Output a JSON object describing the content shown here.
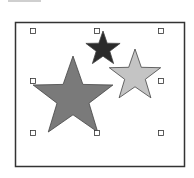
{
  "canvas": {
    "frame": {
      "x": 15.5,
      "y": 22.5,
      "w": 169,
      "h": 144,
      "stroke": "#333333"
    },
    "selection_handles": [
      {
        "x": 33,
        "y": 31
      },
      {
        "x": 97,
        "y": 31
      },
      {
        "x": 161,
        "y": 31
      },
      {
        "x": 33,
        "y": 81
      },
      {
        "x": 161,
        "y": 81
      },
      {
        "x": 33,
        "y": 133
      },
      {
        "x": 97,
        "y": 133
      },
      {
        "x": 161,
        "y": 133
      }
    ],
    "shapes": [
      {
        "name": "large-star",
        "cx": 73,
        "cy": 98,
        "r": 42,
        "fill": "#7a7a7a"
      },
      {
        "name": "dark-star",
        "cx": 103,
        "cy": 49,
        "r": 18,
        "fill": "#2b2b2b"
      },
      {
        "name": "light-star",
        "cx": 135,
        "cy": 76,
        "r": 27,
        "fill": "#c4c4c4"
      }
    ]
  }
}
